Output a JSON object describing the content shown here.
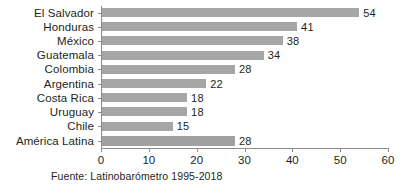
{
  "chart_data": {
    "type": "bar",
    "orientation": "horizontal",
    "title": "",
    "subtitle": "",
    "xlabel": "",
    "ylabel": "",
    "categories": [
      "El Salvador",
      "Honduras",
      "México",
      "Guatemala",
      "Colombia",
      "Argentina",
      "Costa Rica",
      "Uruguay",
      "Chile",
      "América Latina"
    ],
    "values": [
      54,
      41,
      38,
      34,
      28,
      22,
      18,
      18,
      15,
      28
    ],
    "data_labels": [
      "54",
      "41",
      "38",
      "34",
      "28",
      "22",
      "18",
      "18",
      "15",
      "28"
    ],
    "xlim": [
      0,
      60
    ],
    "xticks": [
      0,
      10,
      20,
      30,
      40,
      50,
      60
    ],
    "xtick_labels": [
      "0",
      "10",
      "20",
      "30",
      "40",
      "50",
      "60"
    ],
    "grid": false,
    "legend": false,
    "bar_color": "#a6a6a6",
    "axis_color": "#8c8c8c",
    "text_color": "#231f20",
    "background": "#ffffff"
  },
  "source": {
    "text": "Fuente: Latinobarómetro 1995-2018"
  }
}
